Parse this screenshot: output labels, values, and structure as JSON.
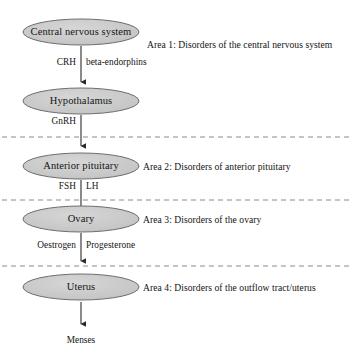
{
  "diagram": {
    "colors": {
      "node_fill": "#c9c9c9",
      "node_stroke": "#6e6e6e",
      "arrow": "#2b2b2b",
      "divider": "#8a8a8a",
      "text": "#141414",
      "background": "#ffffff"
    },
    "nodes": [
      {
        "id": "cns",
        "label": "Central nervous system",
        "cx": 81,
        "cy": 32,
        "rx": 58,
        "ry": 13
      },
      {
        "id": "hypothalamus",
        "label": "Hypothalamus",
        "cx": 81,
        "cy": 101,
        "rx": 58,
        "ry": 13
      },
      {
        "id": "anterior-pituitary",
        "label": "Anterior pituitary",
        "cx": 81,
        "cy": 166,
        "rx": 58,
        "ry": 13
      },
      {
        "id": "ovary",
        "label": "Ovary",
        "cx": 81,
        "cy": 219,
        "rx": 58,
        "ry": 13
      },
      {
        "id": "uterus",
        "label": "Uterus",
        "cx": 81,
        "cy": 287,
        "rx": 58,
        "ry": 13
      }
    ],
    "edges": [
      {
        "id": "cns-to-hypothalamus",
        "left_label": "CRH",
        "right_label": "beta-endorphins",
        "x": 81,
        "y_start": 46,
        "y_end": 86,
        "label_y": 62
      },
      {
        "id": "hypothalamus-to-pituitary",
        "left_label": "GnRH",
        "right_label": "",
        "x": 81,
        "y_start": 115,
        "y_end": 150,
        "label_y": 121
      },
      {
        "id": "pituitary-to-ovary",
        "left_label": "FSH",
        "right_label": "LH",
        "x": 81,
        "y_start": 180,
        "y_end": 213,
        "label_y": 186
      },
      {
        "id": "ovary-to-uterus",
        "left_label": "Oestrogen",
        "right_label": "Progesterone",
        "x": 81,
        "y_start": 233,
        "y_end": 265,
        "label_y": 245
      },
      {
        "id": "uterus-to-menses",
        "left_label": "",
        "right_label": "",
        "x": 81,
        "y_start": 302,
        "y_end": 328,
        "label_y": 0
      }
    ],
    "dividers": [
      {
        "id": "divider-1",
        "y": 137,
        "x1": 2,
        "x2": 352
      },
      {
        "id": "divider-2",
        "y": 200,
        "x1": 2,
        "x2": 352
      },
      {
        "id": "divider-3",
        "y": 266,
        "x1": 2,
        "x2": 352
      }
    ],
    "areas": [
      {
        "id": "area-1",
        "label": "Area 1: Disorders of the central nervous system",
        "x": 147,
        "y": 44
      },
      {
        "id": "area-2",
        "label": "Area 2: Disorders of anterior pituitary",
        "x": 143,
        "y": 162
      },
      {
        "id": "area-3",
        "label": "Area 3: Disorders of the ovary",
        "x": 143,
        "y": 215
      },
      {
        "id": "area-4",
        "label": "Area 4: Disorders of the outflow tract/uterus",
        "x": 143,
        "y": 283
      }
    ],
    "terminal": {
      "id": "menses",
      "label": "Menses",
      "x": 81,
      "y": 340
    }
  }
}
